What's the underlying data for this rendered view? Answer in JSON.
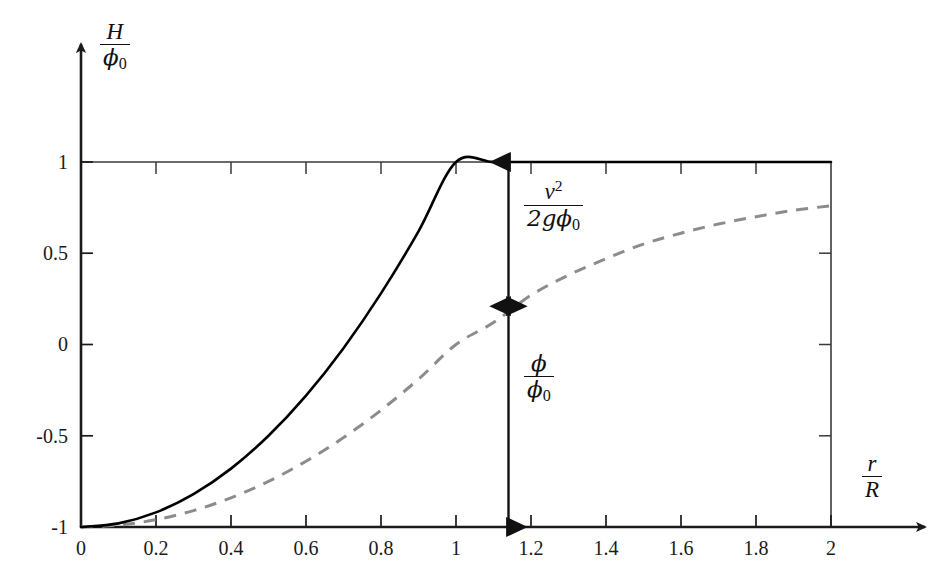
{
  "figure": {
    "background_color": "#ffffff",
    "axis_color": "#1a1a1a",
    "solid_curve_color": "#000000",
    "dashed_curve_color": "#8c8c8c",
    "frame_color": "#3a3a3a"
  },
  "axes": {
    "y_axis_label": {
      "numerator": "H",
      "denominator_symbol": "ϕ",
      "denominator_subscript": "0"
    },
    "x_axis_label": {
      "numerator": "r",
      "denominator": "R"
    },
    "x_ticks": [
      "0",
      "0.2",
      "0.4",
      "0.6",
      "0.8",
      "1",
      "1.2",
      "1.4",
      "1.6",
      "1.8",
      "2"
    ],
    "x_tick_values": [
      0,
      0.2,
      0.4,
      0.6,
      0.8,
      1.0,
      1.2,
      1.4,
      1.6,
      1.8,
      2.0
    ],
    "y_ticks": [
      "1",
      "0.5",
      "0",
      "-0.5",
      "-1"
    ],
    "y_tick_values": [
      1,
      0.5,
      0,
      -0.5,
      -1
    ]
  },
  "annotations": [
    {
      "name": "kinetic-head-bracket",
      "numerator": "v",
      "numerator_superscript": "2",
      "denominator": "2gϕ",
      "denominator_subscript": "0",
      "from_value": 1.0,
      "to_value": 0.21,
      "at_x": 1.14
    },
    {
      "name": "potential-head-bracket",
      "numerator": "ϕ",
      "denominator": "ϕ",
      "denominator_subscript": "0",
      "from_value": 0.21,
      "to_value": -1.0,
      "at_x": 1.14
    }
  ],
  "chart_data": {
    "type": "line",
    "title": "",
    "xlabel": "r/R",
    "ylabel": "H/ϕ0",
    "xlim": [
      0,
      2
    ],
    "ylim": [
      -1,
      1
    ],
    "grid": false,
    "legend_position": "none",
    "xticks": [
      0,
      0.2,
      0.4,
      0.6,
      0.8,
      1.0,
      1.2,
      1.4,
      1.6,
      1.8,
      2.0
    ],
    "yticks": [
      -1,
      -0.5,
      0,
      0.5,
      1
    ],
    "series": [
      {
        "name": "total head H/ϕ0",
        "style": "solid",
        "color": "#000000",
        "width": 2.6,
        "description": "quadratic rise from -1 at r/R=0 to +1 at r/R=1, then constant at 1",
        "x": [
          0,
          0.1,
          0.2,
          0.3,
          0.4,
          0.5,
          0.6,
          0.7,
          0.8,
          0.9,
          1.0,
          1.1,
          1.2,
          1.3,
          1.4,
          1.5,
          1.6,
          1.7,
          1.8,
          1.9,
          2.0
        ],
        "y": [
          -1.0,
          -0.98,
          -0.92,
          -0.82,
          -0.68,
          -0.5,
          -0.28,
          -0.02,
          0.28,
          0.62,
          1.0,
          1.0,
          1.0,
          1.0,
          1.0,
          1.0,
          1.0,
          1.0,
          1.0,
          1.0,
          1.0
        ]
      },
      {
        "name": "potential ϕ/ϕ0",
        "style": "dashed",
        "color": "#8c8c8c",
        "width": 3.0,
        "description": "rises from -1 at r/R=0, crosses 0.21 near r/R=1.14, asymptotes to about 0.76 at r/R=2",
        "x": [
          0,
          0.1,
          0.2,
          0.3,
          0.4,
          0.5,
          0.6,
          0.7,
          0.8,
          0.9,
          1.0,
          1.1,
          1.2,
          1.3,
          1.4,
          1.5,
          1.6,
          1.7,
          1.8,
          1.9,
          2.0
        ],
        "y": [
          -1.0,
          -0.99,
          -0.96,
          -0.91,
          -0.84,
          -0.75,
          -0.64,
          -0.51,
          -0.36,
          -0.19,
          0.0,
          0.12,
          0.27,
          0.38,
          0.47,
          0.55,
          0.61,
          0.66,
          0.7,
          0.735,
          0.76
        ]
      }
    ],
    "annotations": [
      {
        "text": "v^2/(2gϕ0)",
        "type": "double-arrow-vertical",
        "x": 1.14,
        "y_from": 1.0,
        "y_to": 0.21
      },
      {
        "text": "ϕ/ϕ0",
        "type": "double-arrow-vertical",
        "x": 1.14,
        "y_from": 0.21,
        "y_to": -1.0
      }
    ]
  }
}
